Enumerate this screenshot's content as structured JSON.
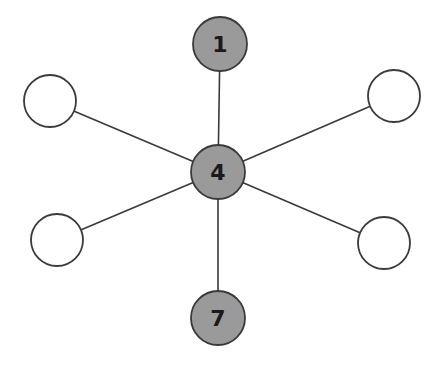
{
  "diagram": {
    "type": "star-graph",
    "colors": {
      "edge": "#3a3a3a",
      "node_stroke": "#3a3a3a",
      "filled_node": "#9a9a9a",
      "empty_node": "#ffffff",
      "label": "#1a1a1a"
    },
    "nodes": [
      {
        "id": "top",
        "label": "1",
        "cx": 220,
        "cy": 44,
        "r": 27,
        "filled": true
      },
      {
        "id": "center",
        "label": "4",
        "cx": 218,
        "cy": 172,
        "r": 27,
        "filled": true
      },
      {
        "id": "bottom",
        "label": "7",
        "cx": 218,
        "cy": 318,
        "r": 27,
        "filled": true
      },
      {
        "id": "top-left",
        "label": "",
        "cx": 50,
        "cy": 101,
        "r": 26,
        "filled": false
      },
      {
        "id": "top-right",
        "label": "",
        "cx": 394,
        "cy": 96,
        "r": 26,
        "filled": false
      },
      {
        "id": "bottom-left",
        "label": "",
        "cx": 57,
        "cy": 240,
        "r": 26,
        "filled": false
      },
      {
        "id": "bottom-right",
        "label": "",
        "cx": 384,
        "cy": 243,
        "r": 26,
        "filled": false
      }
    ],
    "edges": [
      {
        "from": "center",
        "to": "top"
      },
      {
        "from": "center",
        "to": "bottom"
      },
      {
        "from": "center",
        "to": "top-left"
      },
      {
        "from": "center",
        "to": "top-right"
      },
      {
        "from": "center",
        "to": "bottom-left"
      },
      {
        "from": "center",
        "to": "bottom-right"
      }
    ]
  }
}
